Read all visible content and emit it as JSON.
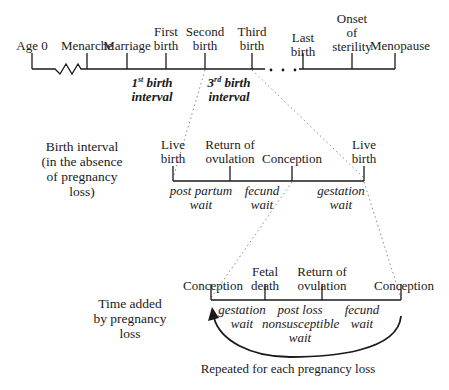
{
  "top_timeline": {
    "events": [
      {
        "label": "Age 0"
      },
      {
        "label": "Menarche"
      },
      {
        "label": "Marriage"
      },
      {
        "label": "First birth"
      },
      {
        "label": "Second birth"
      },
      {
        "label": "Third birth"
      },
      {
        "label": "Last birth"
      },
      {
        "label": "Onset of sterility"
      },
      {
        "label": "Menopause"
      }
    ],
    "event_lines": {
      "age0": "Age 0",
      "menarche": "Menarche",
      "marriage": "Marriage",
      "first_1": "First",
      "first_2": "birth",
      "second_1": "Second",
      "second_2": "birth",
      "third_1": "Third",
      "third_2": "birth",
      "last_1": "Last",
      "last_2": "birth",
      "onset_1": "Onset",
      "onset_2": "of",
      "onset_3": "sterility",
      "menopause": "Menopause"
    },
    "intervals": {
      "first_num": "1",
      "first_sup": "st",
      "first_rest": " birth",
      "first_line2": "interval",
      "third_num": "3",
      "third_sup": "rd",
      "third_rest": " birth",
      "third_line2": "interval"
    },
    "ellipsis": ". . ."
  },
  "middle_section": {
    "side_label": [
      "Birth interval",
      "(in the absence",
      "of pregnancy",
      "loss)"
    ],
    "events": {
      "live1_1": "Live",
      "live1_2": "birth",
      "return_1": "Return of",
      "return_2": "ovulation",
      "conception": "Conception",
      "live2_1": "Live",
      "live2_2": "birth"
    },
    "waits": {
      "postpartum_1": "post partum",
      "postpartum_2": "wait",
      "fecund_1": "fecund",
      "fecund_2": "wait",
      "gestation_1": "gestation",
      "gestation_2": "wait"
    }
  },
  "bottom_section": {
    "side_label": [
      "Time added",
      "by pregnancy",
      "loss"
    ],
    "events": {
      "conception1": "Conception",
      "fetal_1": "Fetal",
      "fetal_2": "death",
      "return_1": "Return of",
      "return_2": "ovulation",
      "conception2": "Conception"
    },
    "waits": {
      "gestation_1": "gestation",
      "gestation_2": "wait",
      "postloss_1": "post loss",
      "postloss_2": "nonsusceptible",
      "postloss_3": "wait",
      "fecund_1": "fecund",
      "fecund_2": "wait"
    },
    "repeat_caption": "Repeated for each pregnancy loss"
  },
  "colors": {
    "line": "#1a1a1a",
    "dotted": "#8a8a8a",
    "background": "#ffffff"
  }
}
